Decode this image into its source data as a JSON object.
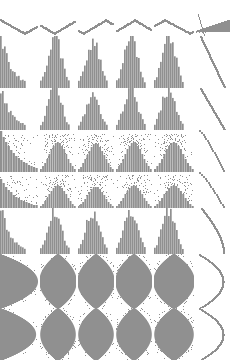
{
  "figure": {
    "kind": "scatterplot-matrix",
    "title": "",
    "background_color": "#ffffff",
    "mark_color": "#909090",
    "width": 230,
    "height": 360,
    "rows": 8,
    "cols": 6
  },
  "chart_data": {
    "type": "scatter",
    "title": "",
    "xlabel": "",
    "ylabel": "",
    "grid": false,
    "legend": "none",
    "xlim": [
      0,
      1
    ],
    "ylim": [
      0,
      1
    ],
    "panel_color": "#909090",
    "row_tops": [
      14,
      36,
      88,
      130,
      172,
      208,
      254,
      308
    ],
    "row_heights": [
      22,
      52,
      42,
      42,
      36,
      46,
      54,
      52
    ],
    "col_lefts": [
      0,
      40,
      78,
      116,
      154,
      196
    ],
    "col_widths": [
      38,
      36,
      36,
      36,
      40,
      34
    ],
    "panels": [
      {
        "row": 0,
        "col": 0,
        "shape": "zigzag-line",
        "amplitude": 0.55,
        "cycles": 1.5,
        "phase": 0.0
      },
      {
        "row": 0,
        "col": 1,
        "shape": "zigzag-line",
        "amplitude": 0.55,
        "cycles": 1.5,
        "phase": 0.4
      },
      {
        "row": 0,
        "col": 2,
        "shape": "zigzag-line",
        "amplitude": 0.55,
        "cycles": 1.5,
        "phase": 0.8
      },
      {
        "row": 0,
        "col": 3,
        "shape": "zigzag-line",
        "amplitude": 0.55,
        "cycles": 1.5,
        "phase": 1.2
      },
      {
        "row": 0,
        "col": 4,
        "shape": "zigzag-line",
        "amplitude": 0.55,
        "cycles": 1.5,
        "phase": 1.6
      },
      {
        "row": 0,
        "col": 5,
        "shape": "triangle-wedge",
        "amplitude": 0.9,
        "cycles": 0,
        "phase": 0.0
      },
      {
        "row": 1,
        "col": 0,
        "shape": "hist-desc",
        "amplitude": 1.0,
        "cycles": 0,
        "phase": 0.0
      },
      {
        "row": 1,
        "col": 1,
        "shape": "hist-bell",
        "amplitude": 1.0,
        "cycles": 0,
        "phase": 0.0
      },
      {
        "row": 1,
        "col": 2,
        "shape": "hist-bell",
        "amplitude": 0.95,
        "cycles": 0,
        "phase": 0.0
      },
      {
        "row": 1,
        "col": 3,
        "shape": "hist-bell",
        "amplitude": 1.0,
        "cycles": 0,
        "phase": 0.0
      },
      {
        "row": 1,
        "col": 4,
        "shape": "hist-bell",
        "amplitude": 1.0,
        "cycles": 0,
        "phase": 0.0
      },
      {
        "row": 1,
        "col": 5,
        "shape": "diagonal-sweep",
        "amplitude": 1.0,
        "cycles": 0,
        "phase": 0.0
      },
      {
        "row": 2,
        "col": 0,
        "shape": "hist-desc",
        "amplitude": 1.0,
        "cycles": 0,
        "phase": 0.0
      },
      {
        "row": 2,
        "col": 1,
        "shape": "hist-bell",
        "amplitude": 1.0,
        "cycles": 0,
        "phase": 0.0
      },
      {
        "row": 2,
        "col": 2,
        "shape": "hist-bell",
        "amplitude": 0.9,
        "cycles": 0,
        "phase": 0.0
      },
      {
        "row": 2,
        "col": 3,
        "shape": "hist-bell",
        "amplitude": 1.0,
        "cycles": 0,
        "phase": 0.0
      },
      {
        "row": 2,
        "col": 4,
        "shape": "hist-bell",
        "amplitude": 1.0,
        "cycles": 0,
        "phase": 0.0
      },
      {
        "row": 2,
        "col": 5,
        "shape": "diagonal-sweep",
        "amplitude": 1.0,
        "cycles": 0,
        "phase": 0.0
      },
      {
        "row": 3,
        "col": 0,
        "shape": "scatter-desc",
        "amplitude": 1.0,
        "cycles": 0,
        "phase": 0.0
      },
      {
        "row": 3,
        "col": 1,
        "shape": "scatter-bell",
        "amplitude": 1.0,
        "cycles": 0,
        "phase": 0.0
      },
      {
        "row": 3,
        "col": 2,
        "shape": "scatter-bell",
        "amplitude": 0.95,
        "cycles": 0,
        "phase": 0.0
      },
      {
        "row": 3,
        "col": 3,
        "shape": "scatter-bell",
        "amplitude": 1.0,
        "cycles": 0,
        "phase": 0.0
      },
      {
        "row": 3,
        "col": 4,
        "shape": "scatter-bell",
        "amplitude": 1.0,
        "cycles": 0,
        "phase": 0.0
      },
      {
        "row": 3,
        "col": 5,
        "shape": "diagonal-dots",
        "amplitude": 1.0,
        "cycles": 0,
        "phase": 0.0
      },
      {
        "row": 4,
        "col": 0,
        "shape": "scatter-desc",
        "amplitude": 0.85,
        "cycles": 0,
        "phase": 0.0
      },
      {
        "row": 4,
        "col": 1,
        "shape": "scatter-bell",
        "amplitude": 0.9,
        "cycles": 0,
        "phase": 0.0
      },
      {
        "row": 4,
        "col": 2,
        "shape": "scatter-bell",
        "amplitude": 0.85,
        "cycles": 0,
        "phase": 0.0
      },
      {
        "row": 4,
        "col": 3,
        "shape": "scatter-bell",
        "amplitude": 0.9,
        "cycles": 0,
        "phase": 0.0
      },
      {
        "row": 4,
        "col": 4,
        "shape": "scatter-bell",
        "amplitude": 0.9,
        "cycles": 0,
        "phase": 0.0
      },
      {
        "row": 4,
        "col": 5,
        "shape": "diagonal-dots",
        "amplitude": 1.0,
        "cycles": 0,
        "phase": 0.0
      },
      {
        "row": 5,
        "col": 0,
        "shape": "hist-desc",
        "amplitude": 1.0,
        "cycles": 0,
        "phase": 0.0
      },
      {
        "row": 5,
        "col": 1,
        "shape": "hist-bell",
        "amplitude": 1.0,
        "cycles": 0,
        "phase": 0.0
      },
      {
        "row": 5,
        "col": 2,
        "shape": "hist-bell",
        "amplitude": 0.95,
        "cycles": 0,
        "phase": 0.0
      },
      {
        "row": 5,
        "col": 3,
        "shape": "hist-bell",
        "amplitude": 1.0,
        "cycles": 0,
        "phase": 0.0
      },
      {
        "row": 5,
        "col": 4,
        "shape": "hist-bell",
        "amplitude": 1.0,
        "cycles": 0,
        "phase": 0.0
      },
      {
        "row": 5,
        "col": 5,
        "shape": "diagonal-arc",
        "amplitude": 1.0,
        "cycles": 0,
        "phase": 0.0
      },
      {
        "row": 6,
        "col": 0,
        "shape": "half-diamond",
        "amplitude": 1.0,
        "cycles": 0,
        "phase": 0.0
      },
      {
        "row": 6,
        "col": 1,
        "shape": "diamond",
        "amplitude": 1.0,
        "cycles": 0,
        "phase": 0.0
      },
      {
        "row": 6,
        "col": 2,
        "shape": "diamond",
        "amplitude": 1.0,
        "cycles": 0,
        "phase": 0.0
      },
      {
        "row": 6,
        "col": 3,
        "shape": "diamond",
        "amplitude": 1.0,
        "cycles": 0,
        "phase": 0.0
      },
      {
        "row": 6,
        "col": 4,
        "shape": "diamond",
        "amplitude": 1.0,
        "cycles": 0,
        "phase": 0.0
      },
      {
        "row": 6,
        "col": 5,
        "shape": "wide-arc",
        "amplitude": 1.0,
        "cycles": 0,
        "phase": 0.0
      },
      {
        "row": 7,
        "col": 0,
        "shape": "half-diamond",
        "amplitude": 0.95,
        "cycles": 0,
        "phase": 0.0
      },
      {
        "row": 7,
        "col": 1,
        "shape": "diamond",
        "amplitude": 0.95,
        "cycles": 0,
        "phase": 0.0
      },
      {
        "row": 7,
        "col": 2,
        "shape": "diamond",
        "amplitude": 0.95,
        "cycles": 0,
        "phase": 0.0
      },
      {
        "row": 7,
        "col": 3,
        "shape": "diamond",
        "amplitude": 0.95,
        "cycles": 0,
        "phase": 0.0
      },
      {
        "row": 7,
        "col": 4,
        "shape": "diamond",
        "amplitude": 0.95,
        "cycles": 0,
        "phase": 0.0
      },
      {
        "row": 7,
        "col": 5,
        "shape": "wide-arc",
        "amplitude": 1.0,
        "cycles": 0,
        "phase": 0.0
      }
    ]
  }
}
